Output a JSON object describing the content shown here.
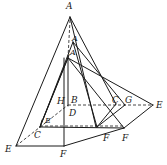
{
  "diagram": {
    "type": "geometry-folding-pyramid",
    "stroke_color": "#1a1a1a",
    "labels": [
      {
        "id": "A_top",
        "text": "A",
        "x": 66,
        "y": 2
      },
      {
        "id": "A_mid",
        "text": "A",
        "x": 72,
        "y": 35
      },
      {
        "id": "A_inner",
        "text": "A",
        "x": 70,
        "y": 49
      },
      {
        "id": "H",
        "text": "H",
        "x": 57,
        "y": 97
      },
      {
        "id": "B",
        "text": "B",
        "x": 71,
        "y": 96
      },
      {
        "id": "D",
        "text": "D",
        "x": 69,
        "y": 109
      },
      {
        "id": "E_inner",
        "text": "E",
        "x": 45,
        "y": 117
      },
      {
        "id": "C_left",
        "text": "C",
        "x": 34,
        "y": 131
      },
      {
        "id": "E_left",
        "text": "E",
        "x": 5,
        "y": 145
      },
      {
        "id": "F_bottom",
        "text": "F",
        "x": 60,
        "y": 150
      },
      {
        "id": "F_mid",
        "text": "F",
        "x": 103,
        "y": 134
      },
      {
        "id": "F_right",
        "text": "F",
        "x": 122,
        "y": 134
      },
      {
        "id": "C_right",
        "text": "C",
        "x": 112,
        "y": 96
      },
      {
        "id": "G",
        "text": "G",
        "x": 125,
        "y": 96
      },
      {
        "id": "E_right",
        "text": "E",
        "x": 156,
        "y": 101
      }
    ]
  }
}
